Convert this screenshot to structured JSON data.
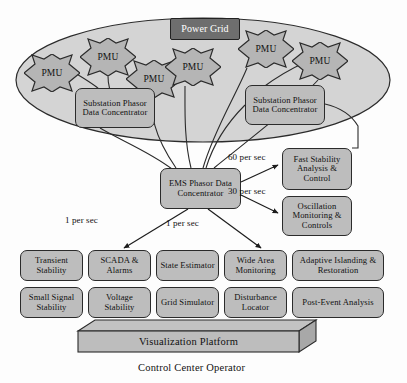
{
  "diagram": {
    "colors": {
      "fill": "#bdbdbd",
      "dark_fill": "#6e6e6e",
      "ellipse_fill": "#d4d4d4",
      "stroke": "#2b2b2b",
      "text": "#111111",
      "dark_text": "#ffffff"
    },
    "grid_cloud": {
      "power_grid_label": "Power Grid",
      "pmu_label": "PMU",
      "pmus": [
        {
          "id": "pmu-1",
          "label": "PMU",
          "x": 24,
          "y": 54
        },
        {
          "id": "pmu-2",
          "label": "PMU",
          "x": 80,
          "y": 38
        },
        {
          "id": "pmu-3",
          "label": "PMU",
          "x": 126,
          "y": 60
        },
        {
          "id": "pmu-4",
          "label": "PMU",
          "x": 165,
          "y": 48
        },
        {
          "id": "pmu-5",
          "label": "PMU",
          "x": 238,
          "y": 30
        },
        {
          "id": "pmu-6",
          "label": "PMU",
          "x": 292,
          "y": 42
        }
      ],
      "substation_pdc_left": "Substation Phasor Data Concentrator",
      "substation_pdc_right": "Substation Phasor Data Concentrator"
    },
    "ems": {
      "label": "EMS Phasor Data Concentrator"
    },
    "fast_apps": [
      {
        "id": "fast-stability",
        "label": "Fast Stability Analysis & Control"
      },
      {
        "id": "oscillation-monitoring",
        "label": "Oscillation Monitoring & Controls"
      }
    ],
    "flow_labels": [
      {
        "id": "rate-60",
        "text": "60 per sec",
        "x": 228,
        "y": 152
      },
      {
        "id": "rate-30",
        "text": "30 per sec",
        "x": 228,
        "y": 186
      },
      {
        "id": "rate-1-left",
        "text": "1 per sec",
        "x": 65,
        "y": 215
      },
      {
        "id": "rate-1-right",
        "text": "1 per sec",
        "x": 166,
        "y": 218
      }
    ],
    "applications": {
      "row1": [
        {
          "id": "transient-stability",
          "label": "Transient Stability"
        },
        {
          "id": "scada-alarms",
          "label": "SCADA & Alarms"
        },
        {
          "id": "state-estimator",
          "label": "State Estimator"
        },
        {
          "id": "wide-area-monitoring",
          "label": "Wide Area Monitoring"
        },
        {
          "id": "adaptive-islanding",
          "label": "Adaptive Islanding & Restoration"
        }
      ],
      "row2": [
        {
          "id": "small-signal-stability",
          "label": "Small Signal Stability"
        },
        {
          "id": "voltage-stability",
          "label": "Voltage Stability"
        },
        {
          "id": "grid-simulator",
          "label": "Grid Simulator"
        },
        {
          "id": "disturbance-locator",
          "label": "Disturbance Locator"
        },
        {
          "id": "post-event-analysis",
          "label": "Post-Event Analysis"
        }
      ]
    },
    "visualization_platform": {
      "label": "Visualization Platform"
    },
    "operator_caption": "Control Center Operator"
  }
}
